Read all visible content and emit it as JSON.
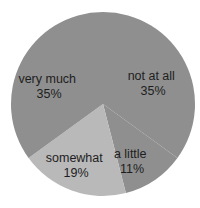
{
  "chart_data": {
    "type": "pie",
    "title": "",
    "start_angle_deg": 0,
    "direction": "clockwise",
    "slices": [
      {
        "label": "not at all",
        "value": 35,
        "display": "35%",
        "color": "#8f8f8f"
      },
      {
        "label": "a little",
        "value": 11,
        "display": "11%",
        "color": "#8f8f8f"
      },
      {
        "label": "somewhat",
        "value": 19,
        "display": "19%",
        "color": "#b9b9b9"
      },
      {
        "label": "very much",
        "value": 35,
        "display": "35%",
        "color": "#8f8f8f"
      }
    ],
    "legend": "none",
    "data_labels": "inside"
  },
  "layout": {
    "cx": 103,
    "cy": 104,
    "r": 92,
    "label_positions": [
      {
        "x": 153,
        "y1": 80,
        "y2": 95
      },
      {
        "x": 132,
        "y1": 158,
        "y2": 173
      },
      {
        "x": 76,
        "y1": 162,
        "y2": 177
      },
      {
        "x": 49,
        "y1": 83,
        "y2": 98
      }
    ]
  }
}
